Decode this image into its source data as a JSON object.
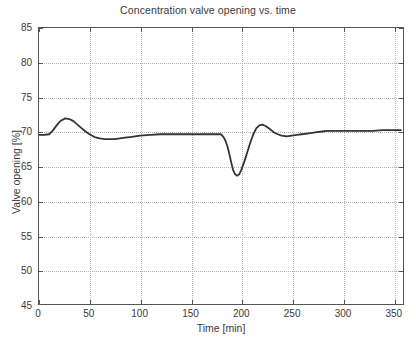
{
  "figure": {
    "background_color": "#ffffff",
    "axes_color": "#555555",
    "grid_color": "#b4b4b4"
  },
  "chart_data": {
    "type": "line",
    "title": "Concentration valve opening vs. time",
    "xlabel": "Time [min]",
    "ylabel": "Valve opening [%]",
    "xlim": [
      0,
      360
    ],
    "ylim": [
      45,
      85
    ],
    "grid": true,
    "legend": null,
    "x_ticks": [
      0,
      50,
      100,
      150,
      200,
      250,
      300,
      350
    ],
    "y_ticks": [
      45,
      50,
      55,
      60,
      65,
      70,
      75,
      80,
      85
    ],
    "series": [
      {
        "name": "Valve opening",
        "color": "#333333",
        "line_width": 1.8,
        "x": [
          0,
          5,
          10,
          14,
          18,
          22,
          26,
          30,
          34,
          38,
          42,
          46,
          50,
          55,
          60,
          65,
          70,
          75,
          80,
          85,
          90,
          95,
          100,
          110,
          120,
          130,
          140,
          150,
          160,
          170,
          175,
          180,
          182,
          184,
          186,
          188,
          190,
          192,
          194,
          196,
          198,
          200,
          203,
          206,
          209,
          212,
          215,
          218,
          221,
          224,
          228,
          232,
          236,
          240,
          245,
          250,
          255,
          260,
          265,
          270,
          275,
          280,
          285,
          290,
          295,
          300,
          310,
          320,
          330,
          340,
          350,
          358
        ],
        "y": [
          69.5,
          69.5,
          69.6,
          70.2,
          71.0,
          71.6,
          71.9,
          71.8,
          71.5,
          71.0,
          70.5,
          70.0,
          69.6,
          69.2,
          69.0,
          68.9,
          68.9,
          68.9,
          69.0,
          69.1,
          69.2,
          69.3,
          69.4,
          69.5,
          69.6,
          69.6,
          69.6,
          69.6,
          69.6,
          69.6,
          69.6,
          69.6,
          69.3,
          68.8,
          68.0,
          66.9,
          65.6,
          64.4,
          63.8,
          63.6,
          63.8,
          64.4,
          65.6,
          67.0,
          68.4,
          69.6,
          70.5,
          70.9,
          71.0,
          70.8,
          70.4,
          69.9,
          69.6,
          69.4,
          69.3,
          69.4,
          69.5,
          69.6,
          69.7,
          69.8,
          69.9,
          70.0,
          70.1,
          70.1,
          70.1,
          70.1,
          70.1,
          70.1,
          70.1,
          70.2,
          70.2,
          70.2
        ]
      }
    ],
    "annotations": []
  },
  "axis_labels": {
    "x_tick_labels": [
      "0",
      "50",
      "100",
      "150",
      "200",
      "250",
      "300",
      "350"
    ],
    "y_tick_labels": [
      "45",
      "50",
      "55",
      "60",
      "65",
      "70",
      "75",
      "80",
      "85"
    ]
  }
}
